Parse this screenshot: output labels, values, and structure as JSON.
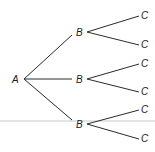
{
  "diagram": {
    "type": "tree",
    "root": {
      "label": "A",
      "x": 12,
      "y": 82,
      "anchor": [
        24,
        79
      ]
    },
    "level1": [
      {
        "label": "B",
        "x": 73,
        "y": 35,
        "anchor": [
          87,
          32
        ]
      },
      {
        "label": "B",
        "x": 73,
        "y": 82,
        "anchor": [
          87,
          79
        ]
      },
      {
        "label": "B",
        "x": 73,
        "y": 127,
        "anchor": [
          87,
          124
        ]
      }
    ],
    "level2": [
      {
        "label": "C",
        "parent": 0,
        "x": 141,
        "y": 19,
        "anchor": [
          139,
          16
        ]
      },
      {
        "label": "C",
        "parent": 0,
        "x": 141,
        "y": 48,
        "anchor": [
          139,
          45
        ]
      },
      {
        "label": "C",
        "parent": 1,
        "x": 141,
        "y": 67,
        "anchor": [
          139,
          64
        ]
      },
      {
        "label": "C",
        "parent": 1,
        "x": 141,
        "y": 95,
        "anchor": [
          139,
          92
        ]
      },
      {
        "label": "C",
        "parent": 2,
        "x": 141,
        "y": 113,
        "anchor": [
          139,
          110
        ]
      },
      {
        "label": "C",
        "parent": 2,
        "x": 141,
        "y": 142,
        "anchor": [
          139,
          139
        ]
      }
    ],
    "colors": {
      "line": "#2a2a2a",
      "text": "#1a1a1a",
      "background": "#ffffff"
    }
  }
}
